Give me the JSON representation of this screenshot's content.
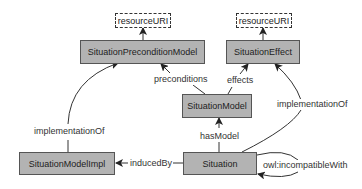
{
  "nodes": {
    "resource_uri_left": "resourceURI",
    "situation_precondition_model": "SituationPreconditionModel",
    "resource_uri_right": "resourceURI",
    "situation_effect": "SituationEffect",
    "situation_model": "SituationModel",
    "situation_model_impl": "SituationModelImpl",
    "situation": "Situation"
  },
  "edges": {
    "preconditions": "preconditions",
    "effects": "effects",
    "has_model": "hasModel",
    "implementation_of_left": "implementationOf",
    "implementation_of_right": "implementationOf",
    "induced_by": "inducedBy",
    "incompatible_with": "owl:incompatibleWith"
  },
  "colors": {
    "node_fill": "#b3b3b3",
    "node_border": "#555555",
    "edge": "#333333"
  }
}
